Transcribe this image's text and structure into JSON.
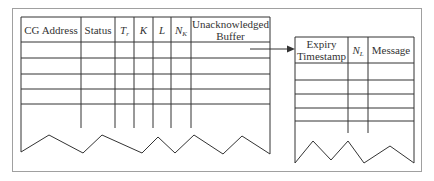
{
  "diagram": {
    "left_table": {
      "name": "CG table",
      "columns": [
        {
          "label": "CG Address"
        },
        {
          "label": "Status"
        },
        {
          "label": "T",
          "sub": "r"
        },
        {
          "label": "K"
        },
        {
          "label": "L"
        },
        {
          "label": "N",
          "sub": "K"
        },
        {
          "label_line1": "Unacknowledged",
          "label_line2": "Buffer"
        }
      ],
      "empty_rows": 5
    },
    "arrow": {
      "from": "Unacknowledged Buffer",
      "to": "buffer table"
    },
    "right_table": {
      "name": "Unacknowledged Buffer table",
      "columns": [
        {
          "label_line1": "Expiry",
          "label_line2": "Timestamp"
        },
        {
          "label": "N",
          "sub": "L"
        },
        {
          "label": "Message"
        }
      ],
      "empty_rows": 4
    },
    "colors": {
      "line": "#333333",
      "frame": "#a0a0a0"
    }
  }
}
